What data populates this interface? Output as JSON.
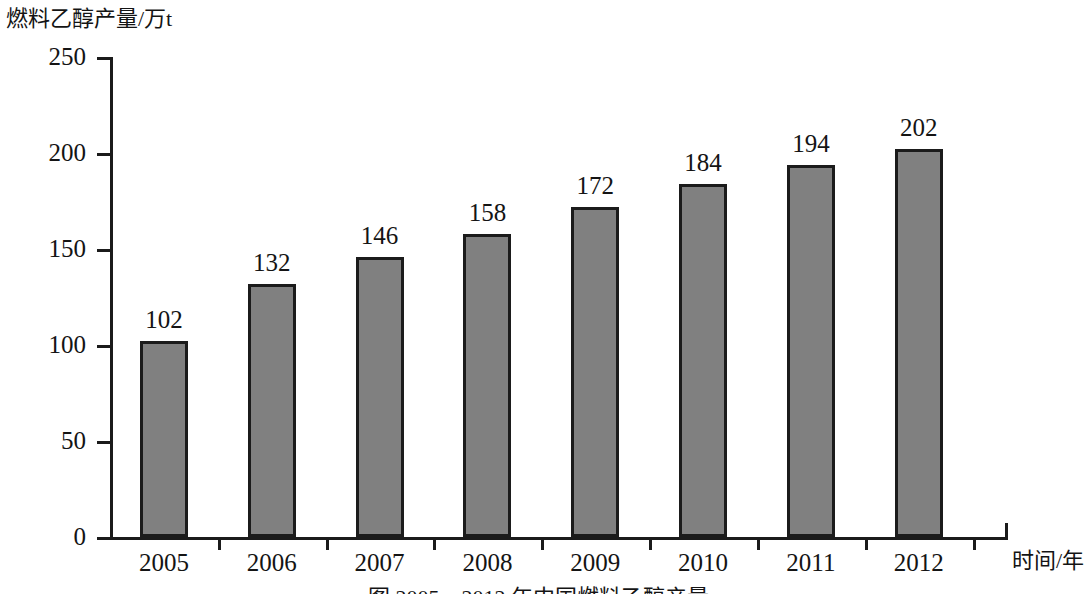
{
  "chart_data": {
    "type": "bar",
    "title": "",
    "ylabel": "燃料乙醇产量/万t",
    "xlabel": "时间/年",
    "categories": [
      "2005",
      "2006",
      "2007",
      "2008",
      "2009",
      "2010",
      "2011",
      "2012"
    ],
    "values": [
      102,
      132,
      146,
      158,
      172,
      184,
      194,
      202
    ],
    "ylim": [
      0,
      250
    ],
    "yticks": [
      "0",
      "50",
      "100",
      "150",
      "200",
      "250"
    ],
    "ytick_values": [
      0,
      50,
      100,
      150,
      200,
      250
    ],
    "grid": false,
    "legend": null,
    "bar_color": "#808080",
    "bar_border_color": "#1b1b1b",
    "axis_color": "#1b1b1b",
    "text_color": "#141414",
    "data_labels": [
      "102",
      "132",
      "146",
      "158",
      "172",
      "184",
      "194",
      "202"
    ],
    "caption": "图 2005—2012 年中国燃料乙醇产量"
  }
}
